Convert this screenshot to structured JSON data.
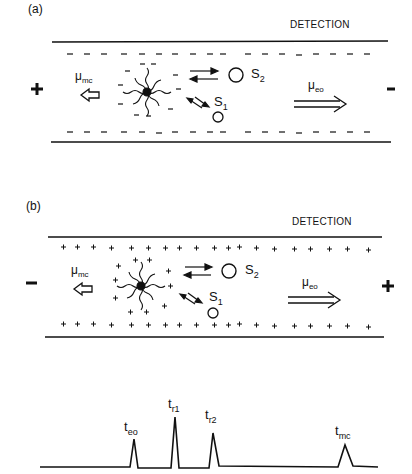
{
  "panels": [
    {
      "id": "a",
      "label": "(a)",
      "detection_label": "DETECTION",
      "wall_charge": "-",
      "micelle_charge": "-",
      "left_pole": "+",
      "right_pole": "-",
      "mu_mc": {
        "base": "μ",
        "sub": "mc"
      },
      "mu_eo": {
        "base": "μ",
        "sub": "eo"
      },
      "solute2": {
        "base": "S",
        "sub": "2"
      },
      "solute1": {
        "base": "S",
        "sub": "1"
      }
    },
    {
      "id": "b",
      "label": "(b)",
      "detection_label": "DETECTION",
      "wall_charge": "+",
      "micelle_charge": "+",
      "left_pole": "−",
      "right_pole": "+",
      "mu_mc": {
        "base": "μ",
        "sub": "mc"
      },
      "mu_eo": {
        "base": "μ",
        "sub": "eo"
      },
      "solute2": {
        "base": "S",
        "sub": "2"
      },
      "solute1": {
        "base": "S",
        "sub": "1"
      }
    }
  ],
  "electropherogram": {
    "peaks": [
      {
        "label": "t",
        "sub": "eo",
        "x": 133,
        "height": 28
      },
      {
        "label": "t",
        "sub": "r1",
        "x": 175,
        "height": 50
      },
      {
        "label": "t",
        "sub": "r2",
        "x": 212,
        "height": 34
      },
      {
        "label": "t",
        "sub": "mc",
        "x": 345,
        "height": 22
      }
    ]
  }
}
